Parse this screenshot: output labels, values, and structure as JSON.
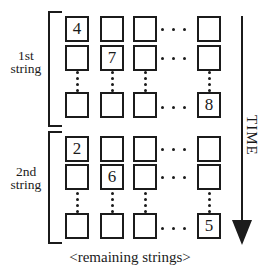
{
  "diagram": {
    "groups": [
      {
        "label": [
          "1st",
          "string"
        ],
        "cells": [
          [
            "4",
            "",
            "",
            ""
          ],
          [
            "",
            "7",
            "",
            ""
          ],
          [
            "",
            "",
            "",
            "8"
          ]
        ]
      },
      {
        "label": [
          "2nd",
          "string"
        ],
        "cells": [
          [
            "2",
            "",
            "",
            ""
          ],
          [
            "",
            "6",
            "",
            ""
          ],
          [
            "",
            "",
            "",
            "5"
          ]
        ]
      }
    ],
    "time_label": "TIME",
    "caption": "<remaining strings>",
    "colors": {
      "ink": "#1b1b1b",
      "background": "#ffffff"
    }
  }
}
